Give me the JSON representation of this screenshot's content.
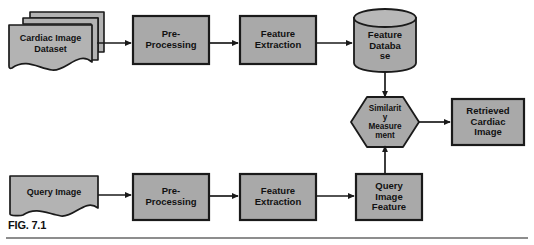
{
  "figure": {
    "caption": "FIG. 7.1",
    "width": 534,
    "height": 245
  },
  "style": {
    "node_fill": "#a9a9a9",
    "doc_fill": "#b3b3b3",
    "stroke": "#1a1a1a",
    "text_color": "#111111",
    "background": "#ffffff",
    "rule_color": "#8d8d8d"
  },
  "nodes": {
    "cardiac_image_dataset": {
      "label": "Cardiac Image\nDataset",
      "shape": "multi-document",
      "x": 8,
      "y": 18,
      "w": 88,
      "h": 50
    },
    "pre_processing_top": {
      "label": "Pre-\nProcessing",
      "shape": "rect",
      "x": 133,
      "y": 16,
      "w": 76,
      "h": 48
    },
    "feature_extraction_top": {
      "label": "Feature\nExtraction",
      "shape": "rect",
      "x": 240,
      "y": 16,
      "w": 76,
      "h": 48
    },
    "feature_database": {
      "label": "Feature\nDataba\nse",
      "shape": "cylinder",
      "x": 354,
      "y": 9,
      "w": 62,
      "h": 63
    },
    "similarity_measurement": {
      "label": "Similarit\ny\nMeasure\nment",
      "shape": "hexagon",
      "x": 352,
      "y": 96,
      "w": 66,
      "h": 52
    },
    "retrieved_cardiac_image": {
      "label": "Retrieved\nCardiac\nImage",
      "shape": "rect",
      "x": 452,
      "y": 99,
      "w": 72,
      "h": 46
    },
    "query_image": {
      "label": "Query Image",
      "shape": "document",
      "x": 10,
      "y": 176,
      "w": 88,
      "h": 44
    },
    "pre_processing_bottom": {
      "label": "Pre-\nProcessing",
      "shape": "rect",
      "x": 133,
      "y": 174,
      "w": 76,
      "h": 46
    },
    "feature_extraction_bottom": {
      "label": "Feature\nExtraction",
      "shape": "rect",
      "x": 240,
      "y": 174,
      "w": 76,
      "h": 46
    },
    "query_image_feature": {
      "label": "Query\nImage\nFeature",
      "shape": "rect",
      "x": 356,
      "y": 174,
      "w": 66,
      "h": 46
    }
  },
  "edges": [
    {
      "name": "dataset-to-preprocessing",
      "from": "cardiac_image_dataset",
      "to": "pre_processing_top",
      "direction": "right"
    },
    {
      "name": "preprocessing-to-extraction-top",
      "from": "pre_processing_top",
      "to": "feature_extraction_top",
      "direction": "right"
    },
    {
      "name": "extraction-to-database",
      "from": "feature_extraction_top",
      "to": "feature_database",
      "direction": "right"
    },
    {
      "name": "database-to-similarity",
      "from": "feature_database",
      "to": "similarity_measurement",
      "direction": "down"
    },
    {
      "name": "similarity-to-retrieved",
      "from": "similarity_measurement",
      "to": "retrieved_cardiac_image",
      "direction": "right"
    },
    {
      "name": "queryimage-to-preprocessing",
      "from": "query_image",
      "to": "pre_processing_bottom",
      "direction": "right"
    },
    {
      "name": "preprocessing-to-extraction-bottom",
      "from": "pre_processing_bottom",
      "to": "feature_extraction_bottom",
      "direction": "right"
    },
    {
      "name": "extraction-to-queryfeature",
      "from": "feature_extraction_bottom",
      "to": "query_image_feature",
      "direction": "right"
    },
    {
      "name": "queryfeature-to-similarity",
      "from": "query_image_feature",
      "to": "similarity_measurement",
      "direction": "up"
    }
  ]
}
